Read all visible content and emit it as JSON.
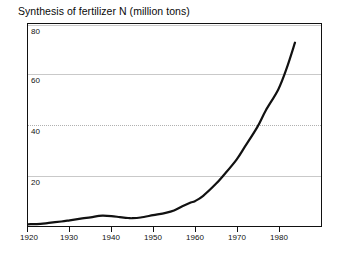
{
  "chart_data": {
    "type": "line",
    "title": "Synthesis of fertilizer N  (million tons)",
    "xlabel": "",
    "ylabel": "",
    "xlim": [
      1920,
      1990
    ],
    "ylim": [
      0,
      86
    ],
    "grid": true,
    "legend": null,
    "x_ticks": [
      1920,
      1930,
      1940,
      1950,
      1960,
      1970,
      1980
    ],
    "x_tick_labels": [
      "1920",
      "1930",
      "1940",
      "1950",
      "1960",
      "1970",
      "1980"
    ],
    "y_ticks": [
      20,
      40,
      60,
      80
    ],
    "y_tick_labels": [
      "20",
      "40",
      "60",
      "80"
    ],
    "series": [
      {
        "name": "Synthesis of fertilizer N",
        "units": "million tons",
        "color": "#111111",
        "x": [
          1920,
          1923,
          1925,
          1928,
          1930,
          1933,
          1935,
          1937,
          1938,
          1940,
          1942,
          1944,
          1945,
          1947,
          1950,
          1953,
          1955,
          1957,
          1959,
          1960,
          1962,
          1965,
          1967,
          1970,
          1972,
          1975,
          1977,
          1980,
          1982,
          1984
        ],
        "values": [
          0.3,
          0.5,
          0.9,
          1.5,
          2.0,
          2.8,
          3.3,
          3.9,
          4.0,
          3.8,
          3.4,
          3.0,
          2.9,
          3.2,
          4.2,
          5.2,
          6.2,
          8.0,
          9.6,
          10.2,
          12.5,
          17.5,
          21.5,
          28.0,
          33.5,
          42.0,
          49.0,
          58.0,
          67.0,
          78.0
        ]
      }
    ]
  },
  "title": {
    "text": "Synthesis of fertilizer N  (million tons)"
  },
  "axes": {
    "y_labels": [
      "80",
      "60",
      "40",
      "20"
    ],
    "x_labels": [
      "1920",
      "1930",
      "1940",
      "1950",
      "1960",
      "1970",
      "1980"
    ]
  },
  "colors": {
    "curve": "#111111",
    "frame": "#111111",
    "grid": "#c9c9c9",
    "background": "#ffffff"
  }
}
